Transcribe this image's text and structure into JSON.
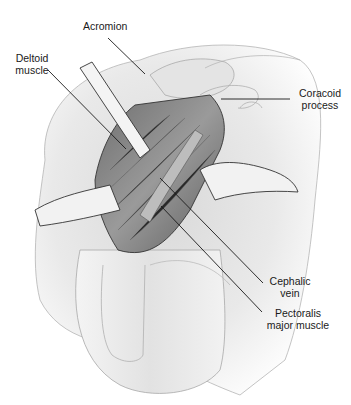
{
  "figure": {
    "labels": {
      "acromion": "Acromion",
      "deltoid_1": "Deltoid",
      "deltoid_2": "muscle",
      "coracoid_1": "Coracoid",
      "coracoid_2": "process",
      "cephalic_1": "Cephalic",
      "cephalic_2": "vein",
      "pectoralis_1": "Pectoralis",
      "pectoralis_2": "major muscle"
    },
    "colors": {
      "line": "#1a1a1a",
      "skin": "#e6e6e6",
      "shadow": "#9a9a9a",
      "muscle": "#7d7d7d",
      "retractor": "#f2f2f2"
    }
  }
}
